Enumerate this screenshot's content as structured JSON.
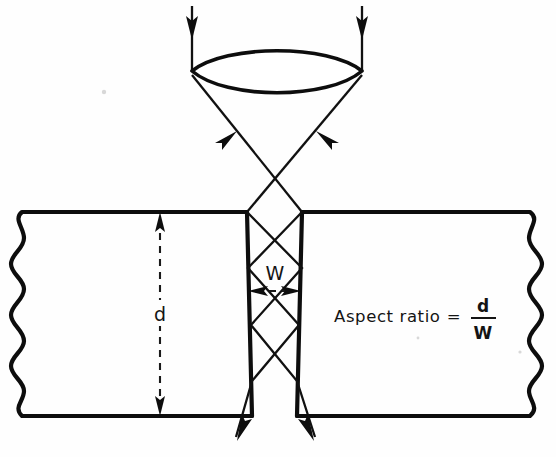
{
  "figure": {
    "background_color": "#fefefe",
    "ink_color": "#0d0d0d"
  },
  "labels": {
    "depth": "d",
    "width": "W",
    "formula_lhs": "Aspect ratio",
    "formula_equals": "=",
    "formula_numerator": "d",
    "formula_denominator": "W"
  },
  "components": {
    "lens_name": "biconvex-lens",
    "substrate_name": "workpiece-substrate",
    "groove_name": "drilled-hole",
    "incoming_beam_name": "incident-laser-beam",
    "focused_beam_name": "focused-laser-beam",
    "exit_beam_name": "exiting-laser-beam",
    "break_edge_name": "wavy-break-edge"
  },
  "geometry": {
    "canvas_width": 556,
    "canvas_height": 457,
    "substrate_top_y": 212,
    "substrate_bottom_y": 416,
    "groove_top_left_x": 247,
    "groove_top_right_x": 302,
    "groove_bottom_left_x": 252,
    "groove_bottom_right_x": 297,
    "lens_center_x": 277,
    "lens_top_y": 46,
    "lens_bottom_y": 92,
    "lens_left_x": 192,
    "lens_right_x": 362,
    "depth_line_x": 160,
    "width_line_y": 291
  }
}
